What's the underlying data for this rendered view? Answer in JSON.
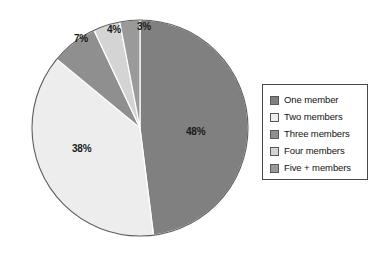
{
  "chart_data": {
    "type": "pie",
    "title": "",
    "categories": [
      "One member",
      "Two members",
      "Three members",
      "Four members",
      "Five + members"
    ],
    "values": [
      48,
      38,
      7,
      4,
      3
    ],
    "value_labels": [
      "48%",
      "38%",
      "7%",
      "4%",
      "3%"
    ],
    "unit": "%",
    "start_angle_deg": 0,
    "direction": "clockwise",
    "legend_position": "right",
    "grid": false,
    "colors": [
      "#808080",
      "#ededed",
      "#8f8f8f",
      "#d4d4d4",
      "#9a9a9a"
    ],
    "slice_border_color": "#ffffff",
    "outline_color": "#5d5d5d",
    "legend_border_color": "#4a4a4a",
    "background": "#ffffff"
  },
  "legend": {
    "items": [
      {
        "label": "One member",
        "color": "#808080"
      },
      {
        "label": "Two members",
        "color": "#ededed"
      },
      {
        "label": "Three members",
        "color": "#8f8f8f"
      },
      {
        "label": "Four members",
        "color": "#d4d4d4"
      },
      {
        "label": "Five + members",
        "color": "#9a9a9a"
      }
    ]
  }
}
